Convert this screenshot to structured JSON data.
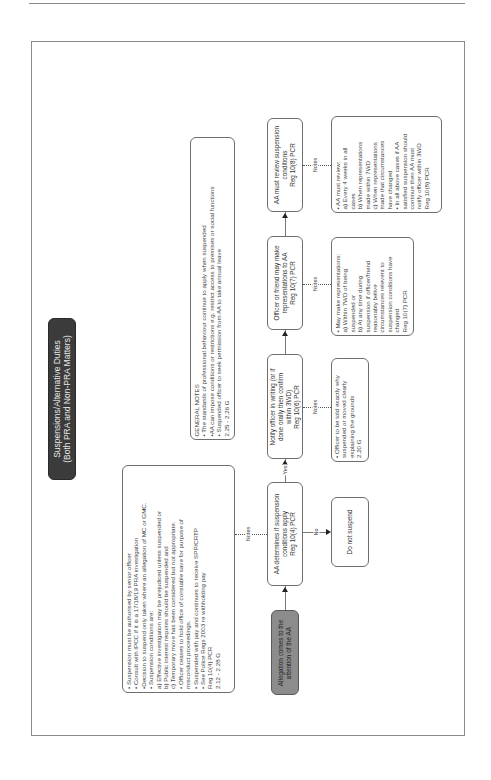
{
  "title": {
    "line1": "Suspensions/Alternative Duties",
    "line2": "(Both PRA and Non-PRA Matters)"
  },
  "suspension_notes": {
    "lines": [
      "• Suspension must be authorised by senior officer",
      "• Consult with IPCC if it is a 17/18/19 PRA investigation",
      "•Decision to suspend only taken where an allegation of MC or GMC.",
      "• Suspension conditions are:",
      "a) Effective investigation may be prejudiced unless suspended or",
      "b) Public interest requires should be suspended and",
      "c) Temporary move has been considered but not appropriate.",
      "• Officer ceases to hold office of constable save for purpose of",
      "misconduct proceedings.",
      "• Suspended with pay and continues to receive SPP/CRTP",
      "• See Police Regs 2003 re withholding pay",
      "Reg 10(4) PCR",
      "2.12 - 2.28 G"
    ]
  },
  "general_notes": {
    "lines": [
      "GENERAL NOTES",
      "• The standards of professional behaviour continue to apply when suspended",
      "•AA can impose conditions or restrictions e.g. restrict access to premises or social functions",
      "• Suspended officer to seek permission from AA to take annual leave",
      "2.25 - 2.26 G"
    ]
  },
  "flow": {
    "allegation": [
      "Allegation comes to the",
      "attention of the AA"
    ],
    "aa_determines": [
      "AA determines if suspension",
      "conditions apply",
      "Reg 10(4) PCR"
    ],
    "notify_officer": [
      "Notify officer in writing (or if",
      "done orally then confirm",
      "within 3WD)",
      "Reg 10(6) PCR"
    ],
    "officer_representations": [
      "Officer or friend may make",
      "representations to AA",
      "Reg 10(7) PCR"
    ],
    "aa_review": [
      "AA must review suspension",
      "conditions",
      "Reg 10(8) PCR"
    ],
    "do_not_suspend": "Do not suspend"
  },
  "edge_labels": {
    "yes": "Yes",
    "no": "No",
    "notes": "Notes"
  },
  "side_notes": {
    "notify": [
      "• Officer to be told exactly why",
      "suspended or moved clearly",
      "explaining the grounds",
      "2.20 G"
    ],
    "representations": [
      "• May make representations:",
      "a) Within 7WD of being",
      "suspended or",
      "b) At any time during",
      "suspension if officer/friend",
      "reasonably belive",
      "circumstances relevent to",
      "suspension conditions have",
      "changed",
      "Reg 10(7) PCR"
    ],
    "review": [
      "• AA must review:",
      "a) Every 4 weeks in all",
      "cases",
      "b) When representations",
      "made within 7WD",
      "c) When representations",
      "made that circumstances",
      "have changed",
      "• In all above cases if AA",
      "satisfied suspension should",
      "continue then AA must",
      "notify officer within 3WD",
      "Reg 10(8) PCR"
    ]
  }
}
